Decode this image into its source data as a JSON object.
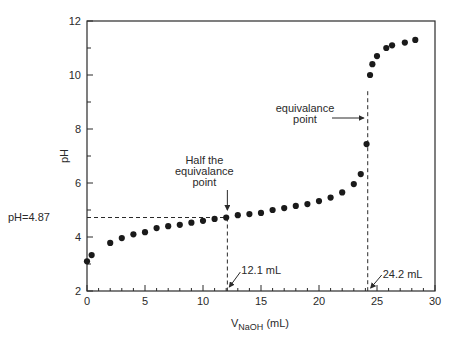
{
  "chart_data": {
    "type": "scatter",
    "title": "",
    "xlabel_main": "V",
    "xlabel_sub": "NaOH",
    "xlabel_unit": " (mL)",
    "ylabel": "pH",
    "xlim": [
      0,
      30
    ],
    "ylim": [
      2,
      12
    ],
    "x_ticks": [
      0,
      5,
      10,
      15,
      20,
      25,
      30
    ],
    "x_minor_step": 1,
    "y_ticks": [
      2,
      4,
      6,
      8,
      10,
      12
    ],
    "y_minor_step": 1,
    "grid": false,
    "series": [
      {
        "name": "titration",
        "x": [
          0,
          0.4,
          2,
          3,
          4,
          5,
          6,
          7,
          8,
          9,
          10,
          11,
          12,
          13,
          14,
          15,
          16,
          17,
          18,
          19,
          20,
          21,
          22,
          23,
          23.6,
          24.1,
          24.4,
          24.6,
          25.0,
          25.8,
          26.3,
          27.4,
          28.3
        ],
        "y": [
          3.1,
          3.33,
          3.78,
          3.96,
          4.1,
          4.18,
          4.33,
          4.4,
          4.45,
          4.53,
          4.6,
          4.67,
          4.72,
          4.81,
          4.85,
          4.89,
          5.0,
          5.07,
          5.15,
          5.22,
          5.33,
          5.46,
          5.65,
          5.96,
          6.33,
          7.44,
          10.0,
          10.4,
          10.7,
          11.0,
          11.1,
          11.2,
          11.3
        ]
      }
    ],
    "annotations": {
      "half_eq_label_lines": [
        "Half the",
        "equivalance",
        "point"
      ],
      "half_eq_x": 12.1,
      "half_eq_ph": 4.87,
      "half_eq_ph_label": "pH=4.87",
      "half_eq_volume_label": "12.1 mL",
      "eq_label_lines": [
        "equivalance",
        "point"
      ],
      "eq_x": 24.2,
      "eq_volume_label": "24.2 mL"
    }
  }
}
